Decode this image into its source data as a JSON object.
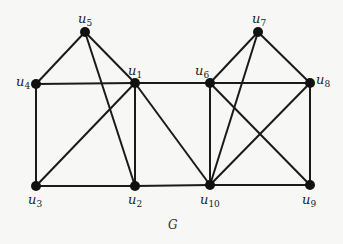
{
  "graph": {
    "caption": "G",
    "nodes": [
      {
        "id": "u1",
        "base": "u",
        "sub": "1",
        "x": 135,
        "y": 83,
        "lx": 128,
        "ly": 75
      },
      {
        "id": "u2",
        "base": "u",
        "sub": "2",
        "x": 135,
        "y": 186,
        "lx": 128,
        "ly": 204
      },
      {
        "id": "u3",
        "base": "u",
        "sub": "3",
        "x": 36,
        "y": 186,
        "lx": 28,
        "ly": 204
      },
      {
        "id": "u4",
        "base": "u",
        "sub": "4",
        "x": 36,
        "y": 84,
        "lx": 16,
        "ly": 86
      },
      {
        "id": "u5",
        "base": "u",
        "sub": "5",
        "x": 85,
        "y": 32,
        "lx": 78,
        "ly": 23
      },
      {
        "id": "u6",
        "base": "u",
        "sub": "6",
        "x": 210,
        "y": 83,
        "lx": 195,
        "ly": 75
      },
      {
        "id": "u7",
        "base": "u",
        "sub": "7",
        "x": 258,
        "y": 32,
        "lx": 252,
        "ly": 23
      },
      {
        "id": "u8",
        "base": "u",
        "sub": "8",
        "x": 310,
        "y": 83,
        "lx": 316,
        "ly": 84
      },
      {
        "id": "u9",
        "base": "u",
        "sub": "9",
        "x": 310,
        "y": 185,
        "lx": 302,
        "ly": 204
      },
      {
        "id": "u10",
        "base": "u",
        "sub": "10",
        "x": 210,
        "y": 185,
        "lx": 200,
        "ly": 204
      }
    ],
    "edges": [
      [
        "u5",
        "u4"
      ],
      [
        "u5",
        "u1"
      ],
      [
        "u5",
        "u2"
      ],
      [
        "u4",
        "u1"
      ],
      [
        "u4",
        "u3"
      ],
      [
        "u1",
        "u3"
      ],
      [
        "u1",
        "u2"
      ],
      [
        "u1",
        "u6"
      ],
      [
        "u1",
        "u10"
      ],
      [
        "u3",
        "u2"
      ],
      [
        "u2",
        "u10"
      ],
      [
        "u7",
        "u6"
      ],
      [
        "u7",
        "u8"
      ],
      [
        "u7",
        "u10"
      ],
      [
        "u6",
        "u8"
      ],
      [
        "u6",
        "u10"
      ],
      [
        "u6",
        "u9"
      ],
      [
        "u8",
        "u10"
      ],
      [
        "u8",
        "u9"
      ],
      [
        "u10",
        "u9"
      ]
    ]
  }
}
